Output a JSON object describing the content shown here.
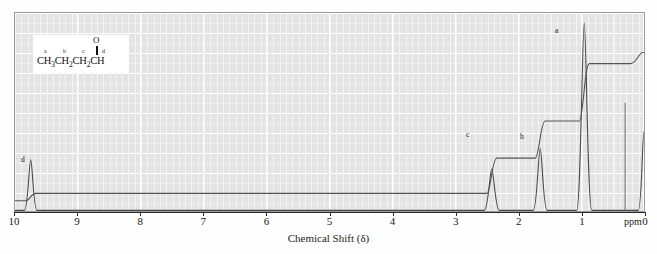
{
  "figure": {
    "kind": "nmr-spectrum",
    "x_axis_title": "Chemical Shift (δ)",
    "x_unit_label": "ppm"
  },
  "structure": {
    "oxygen": "O",
    "formula_text": "CH3CH2CH2CH",
    "atom_labels": [
      "a",
      "b",
      "c",
      "d"
    ],
    "segments": [
      {
        "text": "CH",
        "sub": "3"
      },
      {
        "text": "CH",
        "sub": "2"
      },
      {
        "text": "CH",
        "sub": "2"
      },
      {
        "text": "CH",
        "sub": ""
      }
    ]
  },
  "peak_labels": [
    {
      "id": "d",
      "text": "d",
      "x": 21,
      "y": 156
    },
    {
      "id": "c",
      "text": "c",
      "x": 466,
      "y": 131
    },
    {
      "id": "b",
      "text": "b",
      "x": 520,
      "y": 133
    },
    {
      "id": "a",
      "text": "a",
      "x": 555,
      "y": 27
    }
  ],
  "colors": {
    "plot_background": "#e4e4e4",
    "grid_line": "#ffffff",
    "frame": "#9a9a9a",
    "trace": "#4a4a4a",
    "integration": "#4a4a4a",
    "axis": "#2b2b2b",
    "text": "#1b1b1b"
  },
  "chart_data": {
    "type": "line",
    "title": "",
    "xlabel": "Chemical Shift (δ)",
    "ylabel": "",
    "xlim": [
      10,
      0
    ],
    "ylim": [
      0,
      100
    ],
    "grid": true,
    "legend": null,
    "tick_labels": [
      "10",
      "9",
      "8",
      "7",
      "6",
      "5",
      "4",
      "3",
      "2",
      "1",
      "0"
    ],
    "tick_values": [
      10,
      9,
      8,
      7,
      6,
      5,
      4,
      3,
      2,
      1,
      0
    ],
    "series": [
      {
        "name": "spectrum",
        "peaks": [
          {
            "label": "d",
            "shift_ppm": 9.75,
            "height": 27,
            "width_ppm": 0.09,
            "assignment": "CHO",
            "protons": 1
          },
          {
            "label": "c",
            "shift_ppm": 2.42,
            "height": 22,
            "width_ppm": 0.11,
            "assignment": "CH2 alpha to C=O",
            "protons": 2
          },
          {
            "label": "b",
            "shift_ppm": 1.65,
            "height": 33,
            "width_ppm": 0.1,
            "assignment": "CH2",
            "protons": 2
          },
          {
            "label": "a",
            "shift_ppm": 0.95,
            "height": 100,
            "width_ppm": 0.11,
            "assignment": "CH3",
            "protons": 3
          },
          {
            "label": "TMS",
            "shift_ppm": 0.0,
            "height": 42,
            "width_ppm": 0.08,
            "assignment": "TMS reference",
            "protons": 0
          }
        ]
      },
      {
        "name": "integration",
        "steps": [
          {
            "label": "d",
            "shift_ppm": 9.75,
            "rise": 4
          },
          {
            "label": "c",
            "shift_ppm": 2.42,
            "rise": 19
          },
          {
            "label": "b",
            "shift_ppm": 1.65,
            "rise": 20
          },
          {
            "label": "a",
            "shift_ppm": 0.95,
            "rise": 31
          }
        ],
        "baseline": 3
      }
    ]
  }
}
